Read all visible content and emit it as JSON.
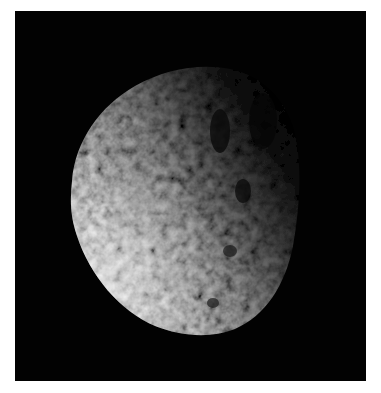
{
  "image": {
    "subject": "cratered moon (irregular satellite) partially lit against black space",
    "background_color": "#020202",
    "page_background": "#ffffff",
    "lit_side": "left",
    "terminator": "diagonal, upper-right to lower-right",
    "colors": {
      "highlight": "#f4f4f4",
      "midtone": "#9a9a9a",
      "shadow": "#2a2a2a",
      "space": "#020202"
    }
  }
}
